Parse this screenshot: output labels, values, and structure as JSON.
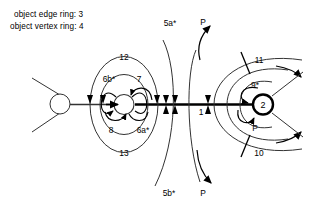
{
  "figure": {
    "notes": {
      "edge_ring": "object edge ring: 3",
      "vertex_ring": "object vertex ring: 4"
    },
    "nodes": {
      "source_label": "",
      "mid_label": "",
      "target_label": "2"
    },
    "labels": {
      "outer_top": "12",
      "outer_bottom": "13",
      "inner_top_left": "6b*",
      "inner_top_right": "7",
      "inner_bottom_left": "8",
      "inner_bottom_right": "6a*",
      "axis_one": "1",
      "flow_top": "5a*",
      "flow_bottom": "5b*",
      "p_top": "P",
      "p_bottom": "P",
      "p_node": "P",
      "ring_top": "11",
      "ring_bottom": "10",
      "loop_right": "9*"
    },
    "colors": {
      "stroke": "#000000",
      "thin_stroke": "#333333",
      "background": "#ffffff"
    }
  }
}
